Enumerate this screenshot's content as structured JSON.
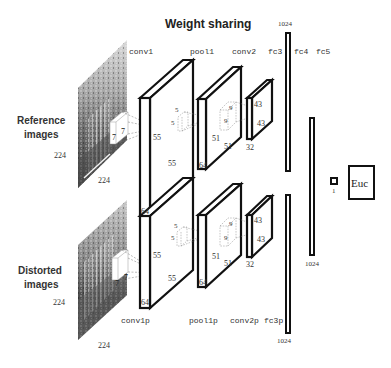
{
  "title": "Weight sharing",
  "inputs": {
    "reference": {
      "label_line1": "Reference",
      "label_line2": "images",
      "height_label": "224",
      "width_label": "224",
      "kernel_a": "7",
      "kernel_b": "7"
    },
    "distorted": {
      "label_line1": "Distorted",
      "label_line2": "images",
      "height_label": "224",
      "width_label": "224",
      "kernel_a": "7",
      "kernel_b": "7"
    }
  },
  "top_branch": {
    "conv1": {
      "name": "conv1",
      "h": "55",
      "w": "55",
      "d": "64"
    },
    "pool1": {
      "name": "pool1",
      "kernel_a": "5",
      "kernel_b": "5",
      "h": "51",
      "w": "51",
      "d": "64"
    },
    "conv2": {
      "name": "conv2",
      "kernel_a": "9",
      "kernel_b": "9",
      "h": "43",
      "w": "43",
      "d": "32"
    },
    "fc3": {
      "name": "fc3",
      "size": "1024"
    }
  },
  "bottom_branch": {
    "conv1": {
      "name": "conv1p",
      "h": "55",
      "w": "55",
      "d": "64"
    },
    "pool1": {
      "name": "pool1p",
      "kernel_a": "5",
      "kernel_b": "5",
      "h": "51",
      "w": "51",
      "d": "64"
    },
    "conv2": {
      "name": "conv2p",
      "kernel_a": "9",
      "kernel_b": "9",
      "h": "43",
      "w": "43",
      "d": "32"
    },
    "fc3": {
      "name": "fc3p",
      "size": "1024"
    }
  },
  "fc4": {
    "name": "fc4",
    "size": "1024"
  },
  "fc5": {
    "name": "fc5",
    "size": "1"
  },
  "output": {
    "label": "Euc"
  },
  "colors": {
    "stroke": "#111111",
    "dashed": "#777777",
    "text": "#222222"
  }
}
